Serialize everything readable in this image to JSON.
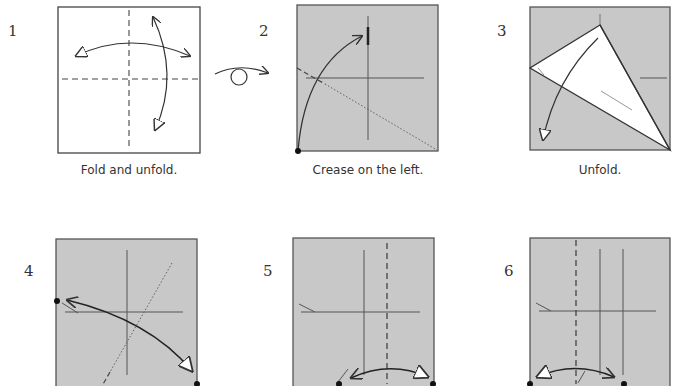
{
  "colors": {
    "paper_colored": "#c8c8c8",
    "paper_white": "#ffffff",
    "line": "#444444",
    "crease": "#555555"
  },
  "steps": [
    {
      "number": "1",
      "caption": "Fold and unfold.",
      "icons": [
        "valley-fold-vertical",
        "valley-fold-horizontal",
        "fold-unfold-arrow-horizontal",
        "fold-unfold-arrow-vertical"
      ]
    },
    {
      "number": "2",
      "caption": "Crease on the left.",
      "icons": [
        "turn-over-symbol",
        "fold-arrow",
        "reference-dot",
        "x-ray-line"
      ]
    },
    {
      "number": "3",
      "caption": "Unfold.",
      "icons": [
        "unfold-arrow"
      ]
    },
    {
      "number": "4",
      "caption": "",
      "icons": [
        "fold-unfold-arrow",
        "reference-dot-left",
        "reference-dot-bottom-right",
        "x-ray-line"
      ]
    },
    {
      "number": "5",
      "caption": "",
      "icons": [
        "valley-fold-vertical",
        "fold-unfold-arrow",
        "reference-dot-left",
        "reference-dot-right"
      ]
    },
    {
      "number": "6",
      "caption": "",
      "icons": [
        "valley-fold-vertical",
        "fold-unfold-arrow",
        "reference-dot-left",
        "reference-dot-right"
      ]
    }
  ]
}
